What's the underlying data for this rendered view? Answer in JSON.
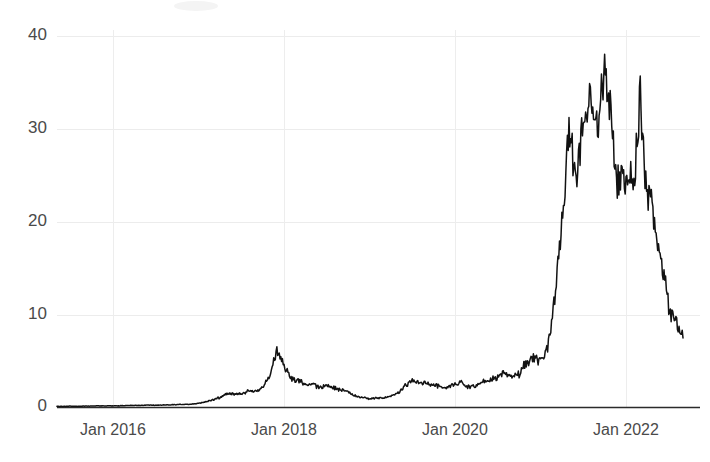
{
  "chart_data": {
    "type": "line",
    "title": "",
    "subtitle": "",
    "xlabel": "",
    "ylabel": "",
    "xlim": [
      "2015-04-01",
      "2022-10-01"
    ],
    "ylim": [
      0,
      41.5
    ],
    "grid": true,
    "legend": null,
    "y_ticks": [
      0,
      10,
      20,
      30,
      40
    ],
    "y_tick_labels": [
      "0",
      "10",
      "20",
      "30",
      "40"
    ],
    "x_ticks": [
      "Jan 2016",
      "Jan 2018",
      "Jan 2020",
      "Jan 2022"
    ],
    "x_tick_labels": [
      "Jan 2016",
      "Jan 2018",
      "Jan 2020",
      "Jan 2022"
    ],
    "line_color": "#121212",
    "grid_color": "#ececec",
    "axis_color": "#2b2b2b",
    "annotations": [],
    "series": [
      {
        "name": "value",
        "x": [
          "2015-04",
          "2015-05",
          "2015-06",
          "2015-07",
          "2015-08",
          "2015-09",
          "2015-10",
          "2015-11",
          "2015-12",
          "2016-01",
          "2016-02",
          "2016-03",
          "2016-04",
          "2016-05",
          "2016-06",
          "2016-07",
          "2016-08",
          "2016-09",
          "2016-10",
          "2016-11",
          "2016-12",
          "2017-01",
          "2017-02",
          "2017-03",
          "2017-04",
          "2017-05",
          "2017-06",
          "2017-07",
          "2017-08",
          "2017-09",
          "2017-10",
          "2017-11",
          "2017-12",
          "2018-01",
          "2018-02",
          "2018-03",
          "2018-04",
          "2018-05",
          "2018-06",
          "2018-07",
          "2018-08",
          "2018-09",
          "2018-10",
          "2018-11",
          "2018-12",
          "2019-01",
          "2019-02",
          "2019-03",
          "2019-04",
          "2019-05",
          "2019-06",
          "2019-07",
          "2019-08",
          "2019-09",
          "2019-10",
          "2019-11",
          "2019-12",
          "2020-01",
          "2020-02",
          "2020-03",
          "2020-04",
          "2020-05",
          "2020-06",
          "2020-07",
          "2020-08",
          "2020-09",
          "2020-10",
          "2020-11",
          "2020-12",
          "2021-01",
          "2021-02",
          "2021-03",
          "2021-04",
          "2021-05",
          "2021-06",
          "2021-07",
          "2021-08",
          "2021-09",
          "2021-10",
          "2021-11",
          "2021-12",
          "2022-01",
          "2022-02",
          "2022-03",
          "2022-04",
          "2022-05",
          "2022-06",
          "2022-07",
          "2022-08",
          "2022-09"
        ],
        "values": [
          0.12,
          0.13,
          0.12,
          0.14,
          0.13,
          0.15,
          0.16,
          0.18,
          0.17,
          0.18,
          0.19,
          0.21,
          0.22,
          0.24,
          0.26,
          0.25,
          0.27,
          0.29,
          0.31,
          0.33,
          0.36,
          0.45,
          0.62,
          0.85,
          1.05,
          1.55,
          1.45,
          1.4,
          1.85,
          1.7,
          2.1,
          3.4,
          6.5,
          4.55,
          3.05,
          2.85,
          2.6,
          2.55,
          2.1,
          2.35,
          2.1,
          1.85,
          1.7,
          1.25,
          1.05,
          0.95,
          1.0,
          1.05,
          1.25,
          1.55,
          2.3,
          2.95,
          2.6,
          2.75,
          2.45,
          2.3,
          2.15,
          2.55,
          2.75,
          2.15,
          2.35,
          2.8,
          2.95,
          3.25,
          3.65,
          3.3,
          3.6,
          4.85,
          5.4,
          4.85,
          6.55,
          12.0,
          20.5,
          29.0,
          24.0,
          31.5,
          35.0,
          30.5,
          36.5,
          31.0,
          23.5,
          25.5,
          24.0,
          33.0,
          22.5,
          21.0,
          15.5,
          11.0,
          9.0,
          7.5
        ]
      }
    ]
  }
}
